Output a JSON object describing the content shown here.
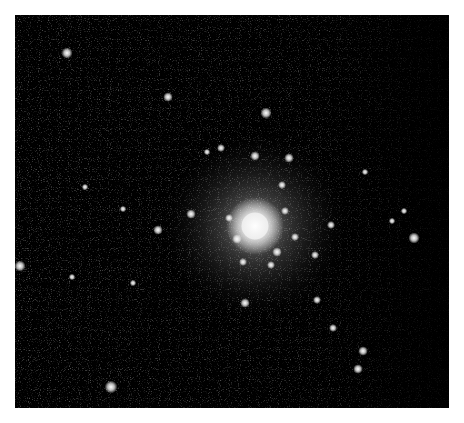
{
  "image": {
    "subject": "globular star cluster",
    "background_color": "#000000",
    "page_color": "#ffffff",
    "frame": {
      "x": 15,
      "y": 15,
      "width": 434,
      "height": 393
    },
    "core": {
      "cx": 240,
      "cy": 211,
      "r": 18
    },
    "halo": {
      "cx": 240,
      "cy": 211,
      "r": 95
    },
    "stars": [
      {
        "x": 52,
        "y": 38,
        "r": 3.5
      },
      {
        "x": 153,
        "y": 82,
        "r": 3
      },
      {
        "x": 251,
        "y": 98,
        "r": 3.5
      },
      {
        "x": 206,
        "y": 133,
        "r": 2.5
      },
      {
        "x": 240,
        "y": 141,
        "r": 3
      },
      {
        "x": 274,
        "y": 143,
        "r": 3
      },
      {
        "x": 192,
        "y": 137,
        "r": 2
      },
      {
        "x": 176,
        "y": 199,
        "r": 3
      },
      {
        "x": 143,
        "y": 215,
        "r": 3
      },
      {
        "x": 108,
        "y": 194,
        "r": 2
      },
      {
        "x": 70,
        "y": 172,
        "r": 2
      },
      {
        "x": 5,
        "y": 251,
        "r": 3.5
      },
      {
        "x": 57,
        "y": 262,
        "r": 2
      },
      {
        "x": 118,
        "y": 268,
        "r": 2
      },
      {
        "x": 96,
        "y": 372,
        "r": 4
      },
      {
        "x": 230,
        "y": 288,
        "r": 3
      },
      {
        "x": 300,
        "y": 240,
        "r": 2.5
      },
      {
        "x": 316,
        "y": 210,
        "r": 2.5
      },
      {
        "x": 302,
        "y": 285,
        "r": 2.5
      },
      {
        "x": 318,
        "y": 313,
        "r": 2.5
      },
      {
        "x": 348,
        "y": 336,
        "r": 3
      },
      {
        "x": 343,
        "y": 354,
        "r": 3
      },
      {
        "x": 399,
        "y": 223,
        "r": 3.5
      },
      {
        "x": 389,
        "y": 196,
        "r": 2
      },
      {
        "x": 377,
        "y": 206,
        "r": 2
      },
      {
        "x": 350,
        "y": 157,
        "r": 2
      },
      {
        "x": 267,
        "y": 170,
        "r": 2.5
      },
      {
        "x": 222,
        "y": 224,
        "r": 3
      },
      {
        "x": 262,
        "y": 237,
        "r": 3
      },
      {
        "x": 270,
        "y": 196,
        "r": 2.5
      },
      {
        "x": 214,
        "y": 203,
        "r": 2.5
      },
      {
        "x": 256,
        "y": 250,
        "r": 2.5
      },
      {
        "x": 228,
        "y": 247,
        "r": 2.5
      },
      {
        "x": 280,
        "y": 222,
        "r": 2.5
      }
    ]
  }
}
